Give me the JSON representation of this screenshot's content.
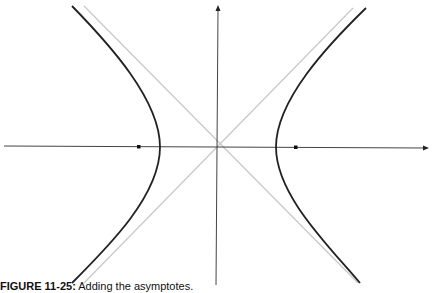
{
  "figure": {
    "caption_label": "FIGURE 11-25:",
    "caption_text": " Adding the asymptotes.",
    "colors": {
      "hyperbola": "#222222",
      "axes": "#333333",
      "asymptotes": "#c8c8c8",
      "foci": "#111111"
    },
    "center": [
      218,
      147
    ],
    "elements": {
      "x_axis": "horizontal axis with arrow at right",
      "y_axis": "vertical axis with arrow at top",
      "asymptotes": "two diagonal lines crossing at center",
      "hyperbola_branches": [
        "left",
        "right"
      ],
      "foci": [
        "left focus",
        "right focus"
      ]
    }
  }
}
